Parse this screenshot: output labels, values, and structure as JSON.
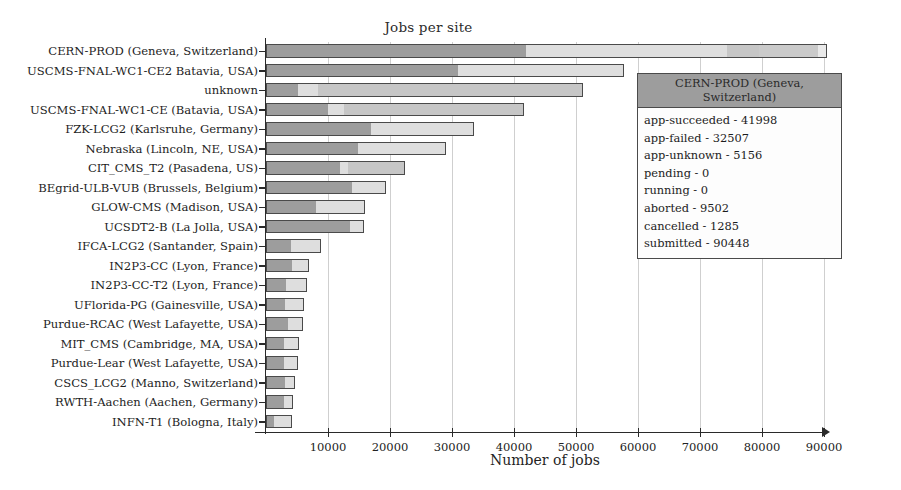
{
  "chart_data": {
    "type": "bar",
    "orientation": "horizontal",
    "stacked": true,
    "title": "Jobs per site",
    "xlabel": "Number of jobs",
    "ylabel": "",
    "xlim": [
      0,
      90000
    ],
    "xticks": [
      10000,
      20000,
      30000,
      40000,
      50000,
      60000,
      70000,
      80000,
      90000
    ],
    "xtick_labels": [
      "10000",
      "20000",
      "30000",
      "40000",
      "50000",
      "60000",
      "70000",
      "80000",
      "90000"
    ],
    "grid": true,
    "legend": "none",
    "series_names": [
      "app-succeeded",
      "app-failed",
      "app-unknown",
      "pending",
      "running",
      "aborted",
      "cancelled"
    ],
    "categories": [
      "CERN-PROD (Geneva, Switzerland)",
      "USCMS-FNAL-WC1-CE2 Batavia, USA)",
      "unknown",
      "USCMS-FNAL-WC1-CE (Batavia, USA)",
      "FZK-LCG2 (Karlsruhe, Germany)",
      "Nebraska (Lincoln, NE, USA)",
      "CIT_CMS_T2 (Pasadena, US)",
      "BEgrid-ULB-VUB (Brussels, Belgium)",
      "GLOW-CMS (Madison, USA)",
      "UCSDT2-B (La Jolla, USA)",
      "IFCA-LCG2 (Santander, Spain)",
      "IN2P3-CC (Lyon, France)",
      "IN2P3-CC-T2 (Lyon, France)",
      "UFlorida-PG (Gainesville, USA)",
      "Purdue-RCAC (West Lafayette, USA)",
      "MIT_CMS (Cambridge, MA, USA)",
      "Purdue-Lear (West Lafayette, USA)",
      "CSCS_LCG2 (Manno, Switzerland)",
      "RWTH-Aachen (Aachen, Germany)",
      "INFN-T1 (Bologna, Italy)"
    ],
    "totals": [
      90448,
      57800,
      51200,
      41600,
      33600,
      29000,
      22400,
      19400,
      16000,
      15800,
      8900,
      7000,
      6600,
      6200,
      6000,
      5400,
      5100,
      4600,
      4400,
      4200
    ],
    "rows": [
      {
        "label": "CERN-PROD (Geneva, Switzerland)",
        "segments": [
          41998,
          32507,
          5156,
          0,
          0,
          9502,
          1285
        ],
        "total": 90448
      },
      {
        "label": "USCMS-FNAL-WC1-CE2 Batavia, USA)",
        "segments": [
          31000,
          26800,
          0,
          0,
          0,
          0,
          0
        ],
        "total": 57800
      },
      {
        "label": "unknown",
        "segments": [
          5100,
          3200,
          42900,
          0,
          0,
          0,
          0
        ],
        "total": 51200
      },
      {
        "label": "USCMS-FNAL-WC1-CE (Batavia, USA)",
        "segments": [
          9900,
          2600,
          29100,
          0,
          0,
          0,
          0
        ],
        "total": 41600
      },
      {
        "label": "FZK-LCG2 (Karlsruhe, Germany)",
        "segments": [
          16900,
          16700,
          0,
          0,
          0,
          0,
          0
        ],
        "total": 33600
      },
      {
        "label": "Nebraska (Lincoln, NE, USA)",
        "segments": [
          14800,
          14200,
          0,
          0,
          0,
          0,
          0
        ],
        "total": 29000
      },
      {
        "label": "CIT_CMS_T2 (Pasadena, US)",
        "segments": [
          12000,
          1300,
          9100,
          0,
          0,
          0,
          0
        ],
        "total": 22400
      },
      {
        "label": "BEgrid-ULB-VUB (Brussels, Belgium)",
        "segments": [
          14000,
          5400,
          0,
          0,
          0,
          0,
          0
        ],
        "total": 19400
      },
      {
        "label": "GLOW-CMS (Madison, USA)",
        "segments": [
          8000,
          8000,
          0,
          0,
          0,
          0,
          0
        ],
        "total": 16000
      },
      {
        "label": "UCSDT2-B (La Jolla, USA)",
        "segments": [
          13600,
          2200,
          0,
          0,
          0,
          0,
          0
        ],
        "total": 15800
      },
      {
        "label": "IFCA-LCG2 (Santander, Spain)",
        "segments": [
          4000,
          4900,
          0,
          0,
          0,
          0,
          0
        ],
        "total": 8900
      },
      {
        "label": "IN2P3-CC (Lyon, France)",
        "segments": [
          4300,
          2700,
          0,
          0,
          0,
          0,
          0
        ],
        "total": 7000
      },
      {
        "label": "IN2P3-CC-T2 (Lyon, France)",
        "segments": [
          3300,
          3300,
          0,
          0,
          0,
          0,
          0
        ],
        "total": 6600
      },
      {
        "label": "UFlorida-PG (Gainesville, USA)",
        "segments": [
          3100,
          3100,
          0,
          0,
          0,
          0,
          0
        ],
        "total": 6200
      },
      {
        "label": "Purdue-RCAC (West Lafayette, USA)",
        "segments": [
          3500,
          2500,
          0,
          0,
          0,
          0,
          0
        ],
        "total": 6000
      },
      {
        "label": "MIT_CMS (Cambridge, MA, USA)",
        "segments": [
          2900,
          2500,
          0,
          0,
          0,
          0,
          0
        ],
        "total": 5400
      },
      {
        "label": "Purdue-Lear (West Lafayette, USA)",
        "segments": [
          2900,
          2200,
          0,
          0,
          0,
          0,
          0
        ],
        "total": 5100
      },
      {
        "label": "CSCS_LCG2 (Manno, Switzerland)",
        "segments": [
          3100,
          1500,
          0,
          0,
          0,
          0,
          0
        ],
        "total": 4600
      },
      {
        "label": "RWTH-Aachen (Aachen, Germany)",
        "segments": [
          2900,
          1500,
          0,
          0,
          0,
          0,
          0
        ],
        "total": 4400
      },
      {
        "label": "INFN-T1 (Bologna, Italy)",
        "segments": [
          1200,
          3000,
          0,
          0,
          0,
          0,
          0
        ],
        "total": 4200
      }
    ]
  },
  "tooltip": {
    "title": "CERN-PROD (Geneva, Switzerland)",
    "rows": [
      "app-succeeded - 41998",
      "app-failed - 32507",
      "app-unknown - 5156",
      "pending - 0",
      "running - 0",
      "aborted - 9502",
      "cancelled - 1285",
      "submitted - 90448"
    ]
  },
  "colors": {
    "bar_primary": "#9d9d9d",
    "bar_secondary": "#dedede",
    "bar_border": "#4a4a4a",
    "grid": "#cfcfcf",
    "axis": "#2a2a2a",
    "background": "#ffffff"
  }
}
